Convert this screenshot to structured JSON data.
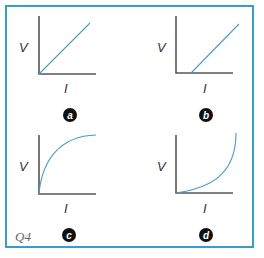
{
  "figure": {
    "question_label": "Q4",
    "frame_color": "#3a9ccc",
    "curve_color": "#4a9cc2",
    "panels": [
      {
        "id": "a",
        "badge": "a",
        "y_label": "V",
        "x_label": "I",
        "curve": "straight line through origin"
      },
      {
        "id": "b",
        "badge": "b",
        "y_label": "V",
        "x_label": "I",
        "curve": "straight line with positive I-intercept"
      },
      {
        "id": "c",
        "badge": "c",
        "y_label": "V",
        "x_label": "I",
        "curve": "concave curve rising then leveling off"
      },
      {
        "id": "d",
        "badge": "d",
        "y_label": "V",
        "x_label": "I",
        "curve": "convex curve rising steeply"
      }
    ]
  }
}
